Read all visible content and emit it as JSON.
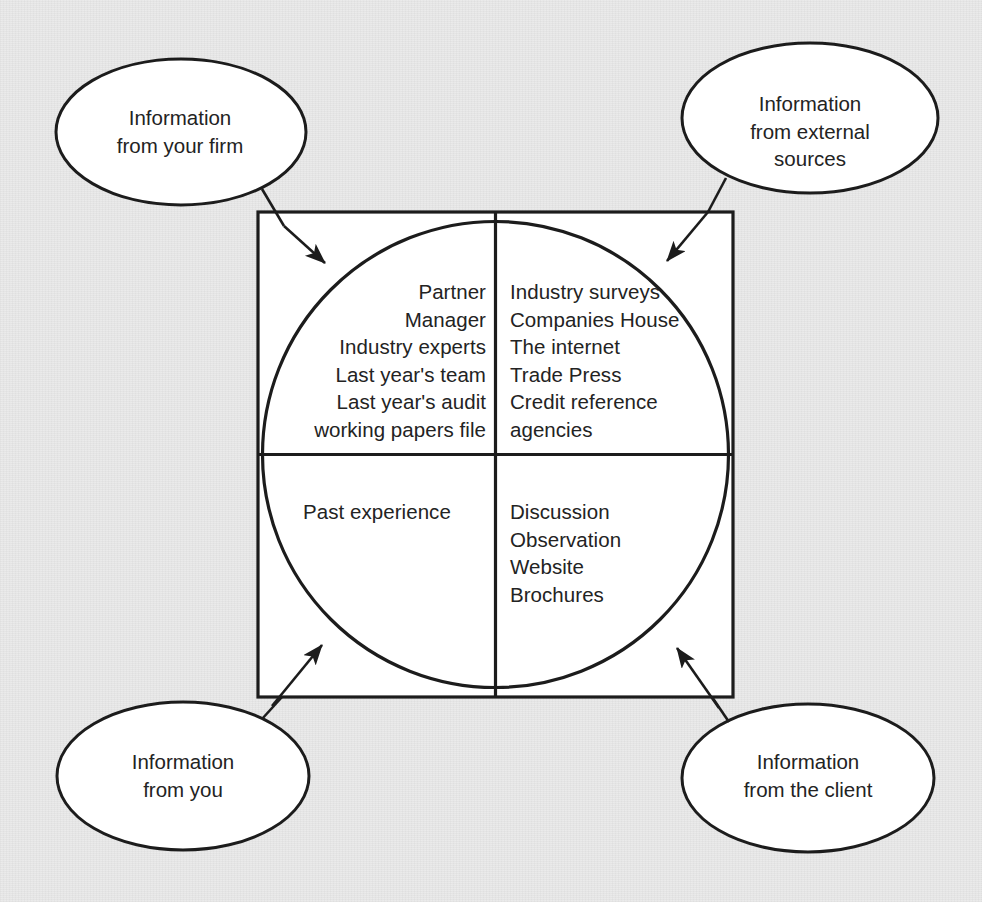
{
  "diagram": {
    "background_color": "#e9e9e9",
    "stroke_color": "#1c1c1c",
    "fill_color": "#ffffff"
  },
  "bubbles": [
    {
      "id": "your-firm",
      "label": "Information\nfrom your firm",
      "position": "top-left"
    },
    {
      "id": "external-sources",
      "label": "Information\nfrom external\nsources",
      "position": "top-right"
    },
    {
      "id": "you",
      "label": "Information\nfrom you",
      "position": "bottom-left"
    },
    {
      "id": "client",
      "label": "Information\nfrom the client",
      "position": "bottom-right"
    }
  ],
  "quadrants": [
    {
      "id": "top-left",
      "source": "your-firm",
      "align": "right",
      "items": "Partner\nManager\nIndustry experts\nLast year's team\nLast year's audit\nworking papers file"
    },
    {
      "id": "top-right",
      "source": "external-sources",
      "align": "left",
      "items": "Industry surveys\nCompanies House\nThe internet\nTrade Press\nCredit reference\n   agencies"
    },
    {
      "id": "bottom-left",
      "source": "you",
      "align": "center",
      "items": "Past experience"
    },
    {
      "id": "bottom-right",
      "source": "client",
      "align": "left",
      "items": "Discussion\nObservation\nWebsite\nBrochures"
    }
  ]
}
